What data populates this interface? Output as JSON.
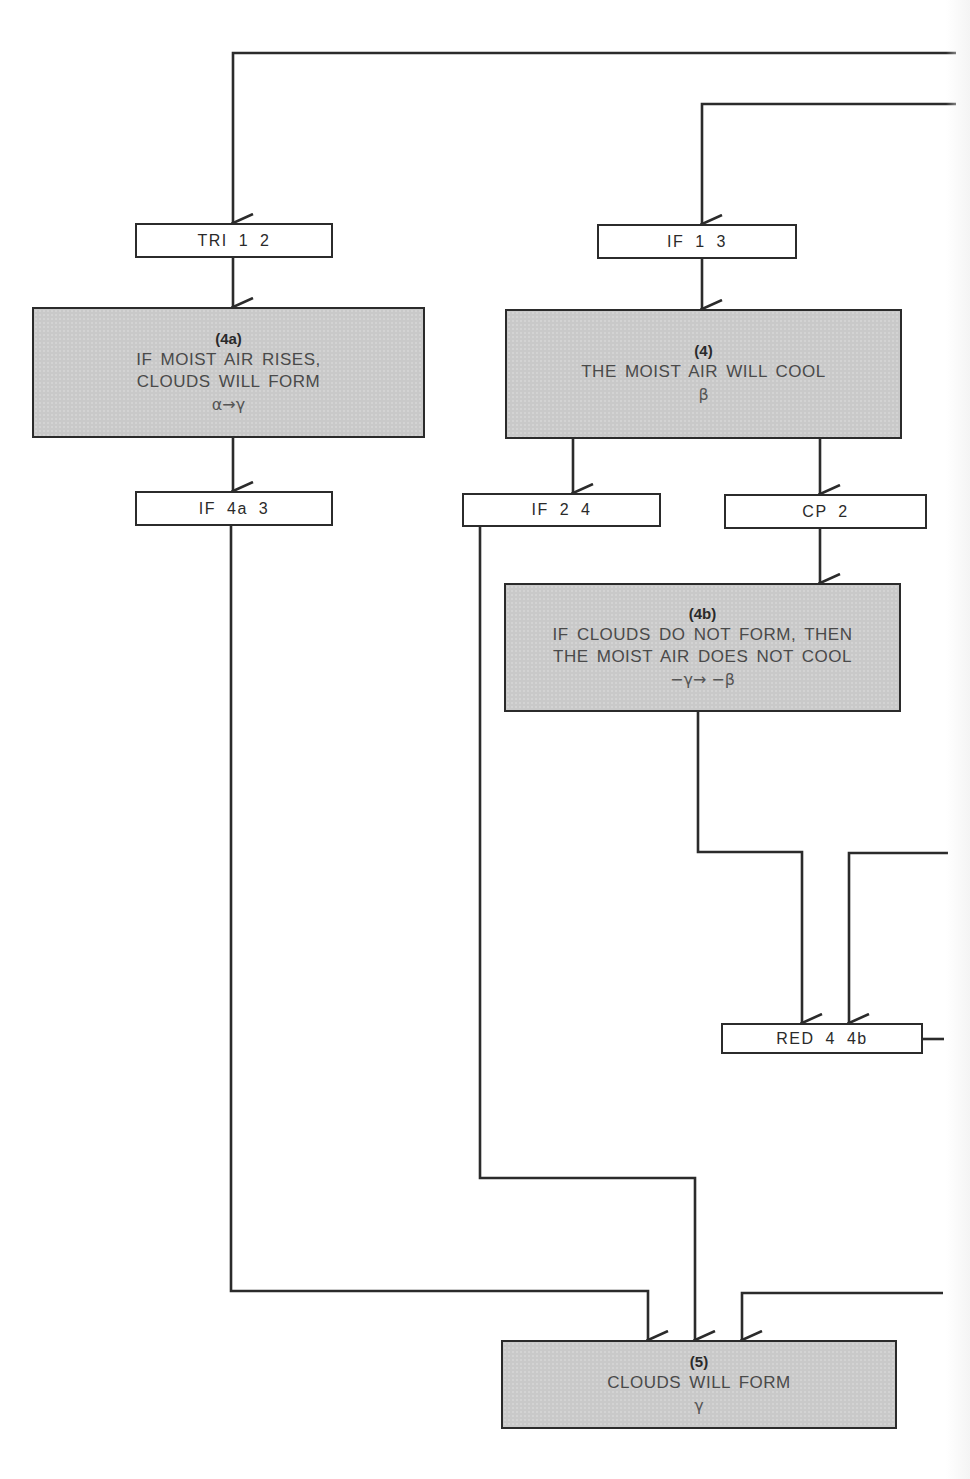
{
  "diagram": {
    "type": "proof-flowchart",
    "colors": {
      "line": "#2b2b2b",
      "statement_fill": "#c9c9c9",
      "rule_fill": "#ffffff",
      "text": "#2a2a2a"
    },
    "rule_boxes": {
      "tri_1_2": {
        "label": "TRI 1 2"
      },
      "if_1_3": {
        "label": "IF 1 3"
      },
      "if_4a_3": {
        "label": "IF 4a 3"
      },
      "if_2_4": {
        "label": "IF 2 4"
      },
      "cp_2": {
        "label": "CP 2"
      },
      "red_4_4b": {
        "label": "RED 4 4b"
      }
    },
    "statements": {
      "s4a": {
        "number": "(4a)",
        "line1": "IF MOIST AIR RISES,",
        "line2": "CLOUDS WILL FORM",
        "formula": "α→γ"
      },
      "s4": {
        "number": "(4)",
        "line1": "THE MOIST AIR WILL COOL",
        "formula": "β"
      },
      "s4b": {
        "number": "(4b)",
        "line1": "IF CLOUDS DO NOT FORM, THEN",
        "line2": "THE MOIST AIR DOES NOT COOL",
        "formula": "−γ→ −β"
      },
      "s5": {
        "number": "(5)",
        "line1": "CLOUDS WILL FORM",
        "formula": "γ"
      }
    },
    "edges": [
      {
        "from": "offscreen-right",
        "to": "TRI 1 2"
      },
      {
        "from": "offscreen-right",
        "to": "IF 1 3"
      },
      {
        "from": "TRI 1 2",
        "to": "(4a)"
      },
      {
        "from": "IF 1 3",
        "to": "(4)"
      },
      {
        "from": "(4a)",
        "to": "IF 4a 3"
      },
      {
        "from": "(4)",
        "to": "IF 2 4"
      },
      {
        "from": "(4)",
        "to": "CP 2"
      },
      {
        "from": "CP 2",
        "to": "(4b)"
      },
      {
        "from": "(4b)",
        "to": "RED 4 4b"
      },
      {
        "from": "offscreen-right",
        "to": "RED 4 4b"
      },
      {
        "from": "RED 4 4b",
        "to": "offscreen-right"
      },
      {
        "from": "IF 4a 3",
        "to": "(5)"
      },
      {
        "from": "IF 2 4",
        "to": "(5)"
      },
      {
        "from": "offscreen-right",
        "to": "(5)"
      }
    ]
  }
}
